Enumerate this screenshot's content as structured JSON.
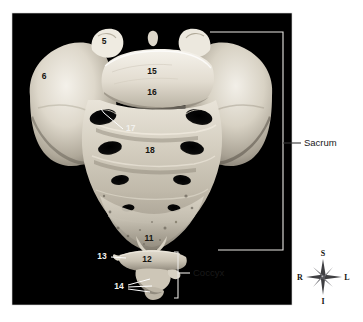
{
  "figure": {
    "title_alt": "Anterior view of sacrum and coccyx",
    "photo_background": "#000000",
    "page_background": "#ffffff",
    "photo_rect": {
      "x": 12,
      "y": 13,
      "width": 280,
      "height": 292
    }
  },
  "numbered_labels": [
    {
      "id": "5",
      "text": "5",
      "x": 104,
      "y": 44,
      "tone": "dark"
    },
    {
      "id": "6",
      "text": "6",
      "x": 44,
      "y": 79,
      "tone": "dark"
    },
    {
      "id": "15",
      "text": "15",
      "x": 152,
      "y": 74,
      "tone": "dark"
    },
    {
      "id": "16",
      "text": "16",
      "x": 152,
      "y": 95,
      "tone": "dark"
    },
    {
      "id": "17",
      "text": "17",
      "x": 126,
      "y": 131,
      "tone": "light"
    },
    {
      "id": "18",
      "text": "18",
      "x": 150,
      "y": 153,
      "tone": "dark"
    },
    {
      "id": "11",
      "text": "11",
      "x": 149,
      "y": 241,
      "tone": "light"
    },
    {
      "id": "12",
      "text": "12",
      "x": 147,
      "y": 262,
      "tone": "dark"
    },
    {
      "id": "13",
      "text": "13",
      "x": 102,
      "y": 259,
      "tone": "light"
    },
    {
      "id": "14",
      "text": "14",
      "x": 119,
      "y": 286,
      "tone": "light"
    }
  ],
  "bracket_callouts": [
    {
      "id": "sacrum",
      "label": "Sacrum",
      "label_x": 305,
      "label_y": 143
    },
    {
      "id": "coccyx",
      "label": "Coccyx",
      "label_x": 196,
      "label_y": 273
    }
  ],
  "compass": {
    "center_x": 323,
    "center_y": 277,
    "superior": "S",
    "inferior": "I",
    "right": "R",
    "left": "L"
  },
  "colors": {
    "bone_highlight": "#f0ece3",
    "bone_mid": "#c9c3b5",
    "bone_shadow": "#8d8779",
    "bone_deep": "#55504a",
    "foramen": "#0a0a0a",
    "callout_stroke": "#e9e8e4",
    "text_dark": "#15130f",
    "text_light": "#f2f1ee"
  }
}
